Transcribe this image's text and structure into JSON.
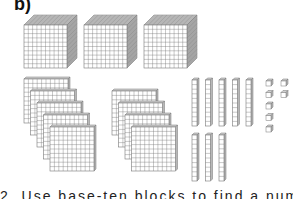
{
  "figure": {
    "label": "b)",
    "groups": {
      "thousands": {
        "name": "thousand cubes",
        "count": 3
      },
      "hundreds": {
        "name": "hundred flats",
        "count": 9,
        "stacks": [
          5,
          4
        ]
      },
      "tens": {
        "name": "ten rods",
        "count": 8,
        "rows": [
          5,
          3
        ]
      },
      "ones": {
        "name": "unit cubes",
        "count": 7,
        "columns": [
          5,
          2
        ]
      }
    },
    "represented_value": 3987,
    "caption_partial": "2. Use base-ten blocks to find a number."
  },
  "colors": {
    "grid": "#777777",
    "face": "#ffffff",
    "top": "#cfcfcf",
    "side": "#b8b8b8"
  }
}
